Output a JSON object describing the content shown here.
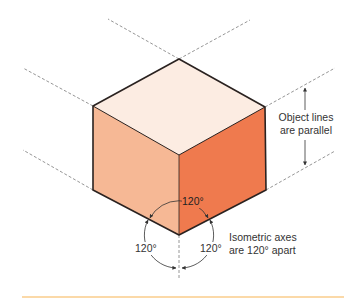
{
  "figure": {
    "colors": {
      "top_face": "#fcece2",
      "left_face": "#f6b895",
      "right_face": "#ef7a4e",
      "edge": "#2a2220",
      "dashed_line": "#8a8a8a",
      "annotation": "#333333",
      "footer_rule": "#fbd9a8"
    },
    "vertices": {
      "top": [
        179,
        59
      ],
      "left_top": [
        93,
        106
      ],
      "right_top": [
        265,
        107
      ],
      "center": [
        179,
        155
      ],
      "left_bottom": [
        93,
        190
      ],
      "right_bottom": [
        266,
        190
      ],
      "bottom": [
        179,
        235
      ]
    },
    "annotations": {
      "parallel_note_line1": "Object lines",
      "parallel_note_line2": "are parallel",
      "axes_note_line1": "Isometric axes",
      "axes_note_line2": "are 120° apart",
      "angle_top": "120°",
      "angle_left": "120°",
      "angle_right": "120°"
    }
  }
}
